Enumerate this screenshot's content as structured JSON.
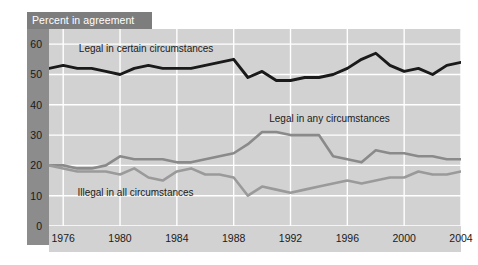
{
  "chart_data": {
    "type": "line",
    "title": "Percent in agreement",
    "xlabel": "",
    "ylabel": "Percent in agreement",
    "xlim": [
      1975,
      2004
    ],
    "ylim": [
      0,
      65
    ],
    "yticks": [
      0,
      10,
      20,
      30,
      40,
      50,
      60
    ],
    "xticks": [
      1976,
      1980,
      1984,
      1988,
      1992,
      1996,
      2000,
      2004
    ],
    "grid": true,
    "legend_position": "inline-annotations",
    "colors": {
      "legal_certain": "#1a1a1a",
      "legal_any": "#8a8a8a",
      "illegal_all": "#9a9a9a",
      "panel_background": "#d2d2d2",
      "gridlines": "#ffffff",
      "banner": "#7d7d7d",
      "left_band": "#8c8c8c"
    },
    "x": [
      1975,
      1976,
      1977,
      1978,
      1979,
      1980,
      1981,
      1982,
      1983,
      1984,
      1985,
      1986,
      1987,
      1988,
      1989,
      1990,
      1991,
      1992,
      1993,
      1994,
      1995,
      1996,
      1997,
      1998,
      1999,
      2000,
      2001,
      2002,
      2003,
      2004
    ],
    "series": [
      {
        "name": "Legal in certain circumstances",
        "color": "#1a1a1a",
        "values": [
          52,
          53,
          52,
          52,
          51,
          50,
          52,
          53,
          52,
          52,
          52,
          53,
          54,
          55,
          49,
          51,
          48,
          48,
          49,
          49,
          50,
          52,
          55,
          57,
          53,
          51,
          52,
          50,
          53,
          54
        ]
      },
      {
        "name": "Legal in any circumstances",
        "color": "#8a8a8a",
        "values": [
          20,
          20,
          19,
          19,
          20,
          23,
          22,
          22,
          22,
          21,
          21,
          22,
          23,
          24,
          27,
          31,
          31,
          30,
          30,
          30,
          23,
          22,
          21,
          25,
          24,
          24,
          23,
          23,
          22,
          22
        ]
      },
      {
        "name": "Illegal in all circumstances",
        "color": "#9a9a9a",
        "values": [
          20,
          19,
          18,
          18,
          18,
          17,
          19,
          16,
          15,
          18,
          19,
          17,
          17,
          16,
          10,
          13,
          12,
          11,
          12,
          13,
          14,
          15,
          14,
          15,
          16,
          16,
          18,
          17,
          17,
          18
        ]
      }
    ],
    "annotations": [
      {
        "text": "Legal in certain circumstances",
        "x": 1977.1,
        "y": 58
      },
      {
        "text": "Legal in any circumstances",
        "x": 1990.5,
        "y": 35
      },
      {
        "text": "Illegal in all circumstances",
        "x": 1977.0,
        "y": 10.5
      }
    ]
  }
}
